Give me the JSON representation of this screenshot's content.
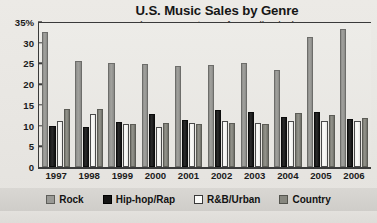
{
  "chart_data": {
    "type": "bar",
    "title": "U.S. Music Sales by Genre",
    "subtitle": "(as a percentage of overall sales)",
    "xlabel": "",
    "ylabel": "",
    "ylim": [
      0,
      35
    ],
    "yticks": [
      0,
      5,
      10,
      15,
      20,
      25,
      30,
      35
    ],
    "ytick_labels": [
      "0",
      "5",
      "10",
      "15",
      "20",
      "25",
      "30",
      "35%"
    ],
    "grid": false,
    "legend_position": "bottom",
    "categories": [
      "1997",
      "1998",
      "1999",
      "2000",
      "2001",
      "2002",
      "2003",
      "2004",
      "2005",
      "2006"
    ],
    "series": [
      {
        "name": "Rock",
        "color": "#9a9a96",
        "values": [
          32.5,
          25.5,
          25.2,
          24.8,
          24.4,
          24.7,
          25.2,
          23.4,
          31.5,
          33.2
        ]
      },
      {
        "name": "Hip-hop/Rap",
        "color": "#141414",
        "values": [
          10.0,
          9.7,
          10.8,
          12.9,
          11.4,
          13.8,
          13.3,
          12.1,
          13.3,
          11.7
        ]
      },
      {
        "name": "R&B/Urban",
        "color": "#fafaf8",
        "values": [
          11.2,
          12.8,
          10.5,
          9.7,
          10.6,
          11.2,
          10.6,
          11.2,
          11.2,
          11.0
        ]
      },
      {
        "name": "Country",
        "color": "#87877f",
        "values": [
          14.0,
          14.1,
          10.5,
          10.7,
          10.5,
          10.7,
          10.4,
          13.0,
          12.5,
          11.8
        ]
      }
    ]
  },
  "legend": {
    "items": [
      {
        "label": "Rock",
        "swatch": "rock"
      },
      {
        "label": "Hip-hop/Rap",
        "swatch": "hiphop"
      },
      {
        "label": "R&B/Urban",
        "swatch": "rnb"
      },
      {
        "label": "Country",
        "swatch": "country"
      }
    ]
  }
}
